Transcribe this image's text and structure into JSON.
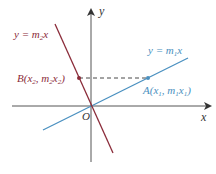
{
  "diagram": {
    "axes": {
      "x_label": "x",
      "y_label": "y",
      "origin_label": "O",
      "axis_color": "#444444"
    },
    "lines": [
      {
        "id": "line1",
        "equation_prefix": "y = m",
        "sub": "1",
        "suffix": "x",
        "color": "#4a90c0"
      },
      {
        "id": "line2",
        "equation_prefix": "y = m",
        "sub": "2",
        "suffix": "x",
        "color": "#8b2c3a"
      }
    ],
    "points": {
      "A": {
        "name": "A",
        "x_var": "x",
        "x_sub": "1",
        "y_var": "m",
        "y_sub": "1",
        "y_var2": "x",
        "y_sub2": "1",
        "color": "#4a90c0"
      },
      "B": {
        "name": "B",
        "x_var": "x",
        "x_sub": "2",
        "y_var": "m",
        "y_sub": "2",
        "y_var2": "x",
        "y_sub2": "2",
        "color": "#8b2c3a"
      }
    },
    "dashed_connector": {
      "from": "B",
      "to": "A",
      "style": "dashed"
    }
  }
}
